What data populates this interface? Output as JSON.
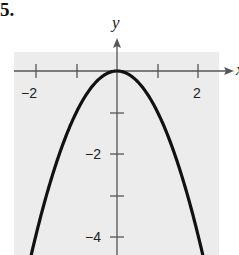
{
  "problem_number": "5.",
  "chart_data": {
    "type": "line",
    "title": "",
    "function": "y = -x^2",
    "xlabel": "x",
    "ylabel": "y",
    "xlim": [
      -2.25,
      2.5
    ],
    "ylim": [
      -4.5,
      0.8
    ],
    "grid": false,
    "background": "#ededed",
    "x_ticks": [
      -2,
      -1,
      0,
      1,
      2
    ],
    "x_tick_labels": [
      "-2",
      "",
      "",
      "",
      "2"
    ],
    "y_ticks": [
      -1,
      -2,
      -3,
      -4
    ],
    "y_tick_labels": [
      "",
      "-2",
      "",
      "-4"
    ],
    "series": [
      {
        "name": "parabola",
        "x": [
          -2.1,
          -2.0,
          -1.5,
          -1.0,
          -0.5,
          0,
          0.5,
          1.0,
          1.5,
          2.0,
          2.1
        ],
        "y": [
          -4.41,
          -4.0,
          -2.25,
          -1.0,
          -0.25,
          0,
          -0.25,
          -1.0,
          -2.25,
          -4.0,
          -4.41
        ]
      }
    ]
  },
  "labels": {
    "x_axis": "x",
    "y_axis": "y",
    "x_minus2": "−2",
    "x_2": "2",
    "y_minus2": "−2",
    "y_minus4": "−4"
  }
}
